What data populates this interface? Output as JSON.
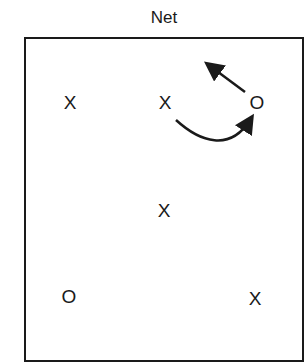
{
  "title": "Net",
  "players": [
    {
      "id": "x1",
      "symbol": "X",
      "x": 70,
      "y": 102
    },
    {
      "id": "x2",
      "symbol": "X",
      "x": 165,
      "y": 102
    },
    {
      "id": "o1",
      "symbol": "O",
      "x": 257,
      "y": 102
    },
    {
      "id": "x3",
      "symbol": "X",
      "x": 164,
      "y": 210
    },
    {
      "id": "o2",
      "symbol": "O",
      "x": 69,
      "y": 296
    },
    {
      "id": "x4",
      "symbol": "X",
      "x": 255,
      "y": 298
    }
  ],
  "arrows": [
    {
      "name": "o-movement-arrow",
      "from": "O",
      "direction": "up-left toward net"
    },
    {
      "name": "x-pass-curve-arrow",
      "from": "X (center front)",
      "to": "O (right front)"
    }
  ],
  "colors": {
    "ink": "#1a1a1a",
    "background": "#ffffff"
  }
}
